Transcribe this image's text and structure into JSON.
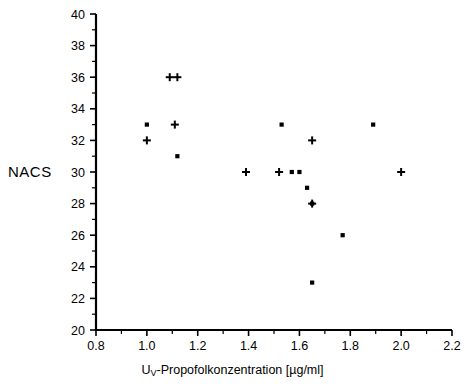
{
  "chart_data": {
    "type": "scatter",
    "title": "",
    "xlabel": "U_V-Propofolkonzentration [µg/ml]",
    "xlabel_prefix": "U",
    "xlabel_sub": "V",
    "xlabel_rest": "-Propofolkonzentration [µg/ml]",
    "ylabel": "NACS",
    "xlim": [
      0.8,
      2.2
    ],
    "ylim": [
      20,
      40
    ],
    "xticks": [
      0.8,
      1.0,
      1.2,
      1.4,
      1.6,
      1.8,
      2.0,
      2.2
    ],
    "xticklabels": [
      "0.8",
      "1.0",
      "1.2",
      "1.4",
      "1.6",
      "1.8",
      "2.0",
      "2.2"
    ],
    "xminor_step": 0.1,
    "yticks": [
      20,
      22,
      24,
      26,
      28,
      30,
      32,
      34,
      36,
      38,
      40
    ],
    "yticklabels": [
      "20",
      "22",
      "24",
      "26",
      "28",
      "30",
      "32",
      "34",
      "36",
      "38",
      "40"
    ],
    "grid": false,
    "legend": null,
    "marker_colors": {
      "dot": "#000000",
      "cross": "#000000"
    },
    "series": [
      {
        "name": "dot-markers",
        "marker": "dot",
        "points": [
          {
            "x": 1.0,
            "y": 33
          },
          {
            "x": 1.12,
            "y": 31
          },
          {
            "x": 1.53,
            "y": 33
          },
          {
            "x": 1.6,
            "y": 30
          },
          {
            "x": 1.63,
            "y": 29
          },
          {
            "x": 1.65,
            "y": 28
          },
          {
            "x": 1.65,
            "y": 23
          },
          {
            "x": 1.77,
            "y": 26
          },
          {
            "x": 1.89,
            "y": 33
          },
          {
            "x": 1.57,
            "y": 30
          }
        ]
      },
      {
        "name": "cross-markers",
        "marker": "cross",
        "points": [
          {
            "x": 1.09,
            "y": 36
          },
          {
            "x": 1.12,
            "y": 36
          },
          {
            "x": 1.11,
            "y": 33
          },
          {
            "x": 1.0,
            "y": 32
          },
          {
            "x": 1.39,
            "y": 30
          },
          {
            "x": 1.52,
            "y": 30
          },
          {
            "x": 1.65,
            "y": 32
          },
          {
            "x": 1.65,
            "y": 28
          },
          {
            "x": 2.0,
            "y": 30
          }
        ]
      }
    ]
  },
  "labels": {
    "ylabel": "NACS"
  }
}
